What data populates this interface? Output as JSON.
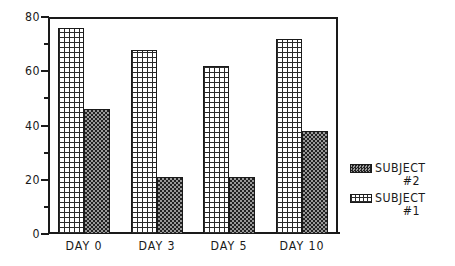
{
  "chart_data": {
    "type": "bar",
    "title": "",
    "subtitle": "",
    "xlabel": "",
    "ylabel": "",
    "categories": [
      "DAY 0",
      "DAY 3",
      "DAY 5",
      "DAY 10"
    ],
    "series": [
      {
        "name": "SUBJECT #1",
        "name_line1": "SUBJECT",
        "name_line2": "#1",
        "pattern": "light-crosshatch-grid",
        "values": [
          76,
          68,
          62,
          72
        ]
      },
      {
        "name": "SUBJECT #2",
        "name_line1": "SUBJECT",
        "name_line2": "#2",
        "pattern": "dark-checker-dots",
        "values": [
          46,
          21,
          21,
          38
        ]
      }
    ],
    "ylim": [
      0,
      80
    ],
    "ytick_labels": [
      "0",
      "20",
      "40",
      "60",
      "80"
    ],
    "ytick_values": [
      0,
      20,
      40,
      60,
      80
    ],
    "yminor_ticks": [
      10,
      30,
      50,
      70
    ],
    "grid": false,
    "legend_position": "right",
    "legend_order": [
      "SUBJECT #2",
      "SUBJECT #1"
    ],
    "colors": {
      "axis": "#1a1a1a",
      "text": "#1a1a1a",
      "background": "#ffffff",
      "series1_ink": "#2b2b2b",
      "series2_ink": "#222222"
    }
  },
  "legend": {
    "entries": [
      {
        "line1": "SUBJECT",
        "line2": "#2",
        "pattern": "dark-checker-dots"
      },
      {
        "line1": "SUBJECT",
        "line2": "#1",
        "pattern": "light-crosshatch-grid"
      }
    ]
  }
}
